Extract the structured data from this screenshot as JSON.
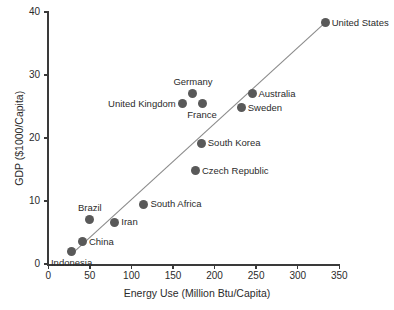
{
  "chart_data": {
    "type": "scatter",
    "title": "",
    "xlabel": "Energy Use (Million Btu/Capita)",
    "ylabel": "GDP ($1000/Capita)",
    "xlim": [
      0,
      350
    ],
    "ylim": [
      0,
      40
    ],
    "xticks": [
      0,
      50,
      100,
      150,
      200,
      250,
      300,
      350
    ],
    "yticks": [
      0,
      10,
      20,
      30,
      40
    ],
    "xtick_labels": [
      "0",
      "50",
      "100",
      "150",
      "200",
      "250",
      "300",
      "350"
    ],
    "ytick_labels": [
      "0",
      "10",
      "20",
      "30",
      "40"
    ],
    "grid": false,
    "legend": "none",
    "marker_color": "#595959",
    "axis_color": "#3a3a3a",
    "trendline": {
      "present": true,
      "color": "#8a8a8a",
      "x_start": 30,
      "y_start": 1.8,
      "x_end": 333,
      "y_end": 38.3
    },
    "points": [
      {
        "label": "United States",
        "x": 333,
        "y": 38.3,
        "label_pos": "right"
      },
      {
        "label": "Australia",
        "x": 245,
        "y": 27.0,
        "label_pos": "right"
      },
      {
        "label": "Germany",
        "x": 174,
        "y": 27.0,
        "label_pos": "above"
      },
      {
        "label": "Sweden",
        "x": 232,
        "y": 24.8,
        "label_pos": "right"
      },
      {
        "label": "United Kingdom",
        "x": 161,
        "y": 25.4,
        "label_pos": "left"
      },
      {
        "label": "France",
        "x": 185,
        "y": 25.4,
        "label_pos": "below"
      },
      {
        "label": "South Korea",
        "x": 184,
        "y": 19.2,
        "label_pos": "right"
      },
      {
        "label": "Czech Republic",
        "x": 177,
        "y": 14.8,
        "label_pos": "right"
      },
      {
        "label": "South Africa",
        "x": 115,
        "y": 9.5,
        "label_pos": "right"
      },
      {
        "label": "Brazil",
        "x": 50,
        "y": 7.1,
        "label_pos": "above"
      },
      {
        "label": "Iran",
        "x": 80,
        "y": 6.6,
        "label_pos": "right"
      },
      {
        "label": "China",
        "x": 41,
        "y": 3.5,
        "label_pos": "right"
      },
      {
        "label": "Indonesia",
        "x": 28,
        "y": 2.0,
        "label_pos": "below"
      }
    ]
  }
}
